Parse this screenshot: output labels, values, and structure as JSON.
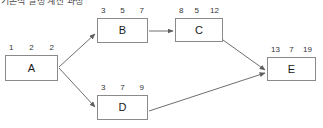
{
  "header": {
    "clipped_title": "기본적 일정 계산 과정"
  },
  "diagram": {
    "type": "activity-on-node-network",
    "colors": {
      "node_border": "#8a8a8a",
      "edge": "#6e6e6e",
      "text": "#1a1a1a",
      "background": "#ffffff"
    },
    "nodes": [
      {
        "id": "A",
        "label": "A",
        "values": [
          1,
          2,
          2
        ],
        "x": 5,
        "y": 55,
        "w": 53,
        "h": 26
      },
      {
        "id": "B",
        "label": "B",
        "values": [
          3,
          5,
          7
        ],
        "x": 97,
        "y": 18,
        "w": 51,
        "h": 25
      },
      {
        "id": "C",
        "label": "C",
        "values": [
          8,
          5,
          12
        ],
        "x": 175,
        "y": 18,
        "w": 48,
        "h": 24
      },
      {
        "id": "D",
        "label": "D",
        "values": [
          3,
          7,
          9
        ],
        "x": 97,
        "y": 95,
        "w": 51,
        "h": 25
      },
      {
        "id": "E",
        "label": "E",
        "values": [
          13,
          7,
          19
        ],
        "x": 267,
        "y": 57,
        "w": 49,
        "h": 24
      }
    ],
    "edges": [
      {
        "from": "A",
        "to": "B",
        "direction": "up-right"
      },
      {
        "from": "A",
        "to": "D",
        "direction": "down-right"
      },
      {
        "from": "B",
        "to": "C",
        "direction": "right"
      },
      {
        "from": "C",
        "to": "E",
        "direction": "down-right"
      },
      {
        "from": "D",
        "to": "E",
        "direction": "up-right"
      }
    ]
  }
}
